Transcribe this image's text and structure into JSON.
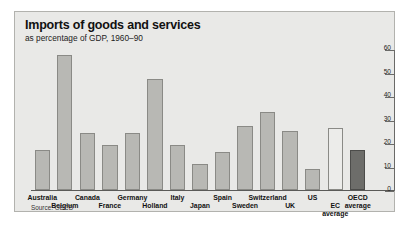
{
  "figure": {
    "title": "Imports of goods and services",
    "subtitle": "as percentage of GDP, 1960–90",
    "source": "Source: OECD",
    "panel_bg": "#e9e9e7",
    "bar_color": "#b8b8b4",
    "bar_highlight_color": "#6d6d6a",
    "bar_open_color": "#ececea"
  },
  "chart_data": {
    "type": "bar",
    "title": "Imports of goods and services",
    "subtitle": "as percentage of GDP, 1960–90",
    "xlabel": "",
    "ylabel": "",
    "ylim": [
      0,
      60
    ],
    "yticks": [
      0,
      10,
      20,
      30,
      40,
      50,
      60
    ],
    "ytick_labels": [
      "0",
      "10",
      "20",
      "30",
      "40",
      "50",
      "60"
    ],
    "grid": false,
    "legend": "none",
    "axis_position": "right",
    "source": "Source: OECD",
    "categories": [
      "Australia",
      "Belgium",
      "Canada",
      "France",
      "Germany",
      "Holland",
      "Italy",
      "Japan",
      "Spain",
      "Sweden",
      "Switzerland",
      "UK",
      "US",
      "EC average",
      "OECD average"
    ],
    "category_lines": [
      [
        "Australia"
      ],
      [
        "Belgium"
      ],
      [
        "Canada"
      ],
      [
        "France"
      ],
      [
        "Germany"
      ],
      [
        "Holland"
      ],
      [
        "Italy"
      ],
      [
        "Japan"
      ],
      [
        "Spain"
      ],
      [
        "Sweden"
      ],
      [
        "Switzerland"
      ],
      [
        "UK"
      ],
      [
        "US"
      ],
      [
        "EC",
        "average"
      ],
      [
        "OECD",
        "average"
      ]
    ],
    "label_row": [
      0,
      1,
      0,
      1,
      0,
      1,
      0,
      1,
      0,
      1,
      0,
      1,
      0,
      1,
      0
    ],
    "values": [
      17,
      57,
      24,
      19,
      24,
      47,
      19,
      11,
      16,
      27,
      33,
      25,
      9,
      26,
      17
    ],
    "bar_styles": [
      "normal",
      "normal",
      "normal",
      "normal",
      "normal",
      "normal",
      "normal",
      "normal",
      "normal",
      "normal",
      "normal",
      "normal",
      "normal",
      "open",
      "dark"
    ]
  }
}
